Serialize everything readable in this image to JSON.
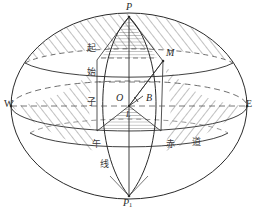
{
  "figure": {
    "background_color": "#ffffff",
    "line_color": "#2a2a2a",
    "hatch_color": "#4a4a4a"
  },
  "labels": {
    "north_pole": "P",
    "south_pole_base": "P",
    "south_pole_sub": "1",
    "point_m": "M",
    "center_o": "O",
    "point_b": "B",
    "point_l": "L",
    "west": "W",
    "east": "E"
  },
  "annotations": {
    "prime_meridian_chars": [
      "起",
      "始",
      "子",
      "午",
      "线"
    ],
    "equator_chars": [
      "赤",
      "道"
    ]
  },
  "geometry": {
    "sphere_center": [
      129,
      106
    ],
    "sphere_rx": 118,
    "sphere_ry": 93,
    "pole_north": [
      129,
      17
    ],
    "pole_south": [
      129,
      196
    ],
    "point_m": [
      163,
      61
    ],
    "point_o": [
      129,
      106
    ],
    "point_b": [
      140,
      100
    ],
    "equator_ry": 22,
    "polar_cap_ry": 18
  }
}
